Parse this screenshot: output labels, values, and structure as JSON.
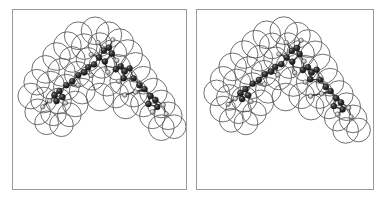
{
  "figure": {
    "kind": "stereo-pair-molecular-model",
    "panel_count": 2,
    "background_color": "#ffffff",
    "frame_color": "#9a9a9a",
    "vdw_outline_color": "#555555",
    "bond_color": "#3a3a3a",
    "atom_dark_color": "#1b1b1b",
    "atom_light_color": "#b4b4b4"
  },
  "panels": [
    {
      "id": "panel-left",
      "label": "left-eye-view",
      "x": 12,
      "y": 9,
      "width": 175,
      "height": 181,
      "view_offset_x": 0
    },
    {
      "id": "panel-right",
      "label": "right-eye-view",
      "x": 196,
      "y": 9,
      "width": 178,
      "height": 181,
      "view_offset_x": 2.5
    }
  ],
  "molecule": {
    "shape": "inverted-V / chevron arrangement of two extended arms meeting at an apex",
    "vdw_spheres": [
      {
        "cx": 66,
        "cy": 26,
        "r": 14
      },
      {
        "cx": 83,
        "cy": 21,
        "r": 14
      },
      {
        "cx": 97,
        "cy": 25,
        "r": 13
      },
      {
        "cx": 108,
        "cy": 33,
        "r": 14
      },
      {
        "cx": 55,
        "cy": 36,
        "r": 14
      },
      {
        "cx": 72,
        "cy": 37,
        "r": 13
      },
      {
        "cx": 88,
        "cy": 35,
        "r": 12
      },
      {
        "cx": 101,
        "cy": 44,
        "r": 14
      },
      {
        "cx": 116,
        "cy": 45,
        "r": 15
      },
      {
        "cx": 44,
        "cy": 47,
        "r": 14
      },
      {
        "cx": 60,
        "cy": 50,
        "r": 13
      },
      {
        "cx": 76,
        "cy": 50,
        "r": 12
      },
      {
        "cx": 90,
        "cy": 56,
        "r": 13
      },
      {
        "cx": 106,
        "cy": 58,
        "r": 13
      },
      {
        "cx": 124,
        "cy": 58,
        "r": 15
      },
      {
        "cx": 33,
        "cy": 60,
        "r": 14
      },
      {
        "cx": 49,
        "cy": 63,
        "r": 14
      },
      {
        "cx": 65,
        "cy": 65,
        "r": 13
      },
      {
        "cx": 80,
        "cy": 68,
        "r": 13
      },
      {
        "cx": 95,
        "cy": 72,
        "r": 15
      },
      {
        "cx": 112,
        "cy": 72,
        "r": 14
      },
      {
        "cx": 132,
        "cy": 71,
        "r": 14
      },
      {
        "cx": 24,
        "cy": 73,
        "r": 13
      },
      {
        "cx": 38,
        "cy": 76,
        "r": 14
      },
      {
        "cx": 54,
        "cy": 78,
        "r": 13
      },
      {
        "cx": 70,
        "cy": 82,
        "r": 13
      },
      {
        "cx": 88,
        "cy": 88,
        "r": 14
      },
      {
        "cx": 104,
        "cy": 86,
        "r": 13
      },
      {
        "cx": 122,
        "cy": 84,
        "r": 14
      },
      {
        "cx": 142,
        "cy": 83,
        "r": 14
      },
      {
        "cx": 18,
        "cy": 87,
        "r": 13
      },
      {
        "cx": 31,
        "cy": 91,
        "r": 13
      },
      {
        "cx": 46,
        "cy": 92,
        "r": 13
      },
      {
        "cx": 63,
        "cy": 95,
        "r": 13
      },
      {
        "cx": 114,
        "cy": 97,
        "r": 13
      },
      {
        "cx": 132,
        "cy": 95,
        "r": 13
      },
      {
        "cx": 150,
        "cy": 95,
        "r": 14
      },
      {
        "cx": 25,
        "cy": 103,
        "r": 13
      },
      {
        "cx": 41,
        "cy": 104,
        "r": 13
      },
      {
        "cx": 57,
        "cy": 106,
        "r": 12
      },
      {
        "cx": 141,
        "cy": 107,
        "r": 13
      },
      {
        "cx": 157,
        "cy": 107,
        "r": 14
      },
      {
        "cx": 34,
        "cy": 114,
        "r": 12
      },
      {
        "cx": 49,
        "cy": 116,
        "r": 12
      },
      {
        "cx": 150,
        "cy": 119,
        "r": 13
      },
      {
        "cx": 163,
        "cy": 118,
        "r": 12
      }
    ],
    "atoms": [
      {
        "cx": 86,
        "cy": 33,
        "r": 2.3,
        "kind": "light"
      },
      {
        "cx": 101,
        "cy": 30,
        "r": 2.2,
        "kind": "light"
      },
      {
        "cx": 92,
        "cy": 41,
        "r": 3.1,
        "kind": "dark"
      },
      {
        "cx": 97,
        "cy": 38,
        "r": 3.0,
        "kind": "dark"
      },
      {
        "cx": 100,
        "cy": 44,
        "r": 3.0,
        "kind": "dark"
      },
      {
        "cx": 79,
        "cy": 45,
        "r": 2.2,
        "kind": "light"
      },
      {
        "cx": 87,
        "cy": 48,
        "r": 3.0,
        "kind": "dark"
      },
      {
        "cx": 93,
        "cy": 52,
        "r": 2.9,
        "kind": "dark"
      },
      {
        "cx": 105,
        "cy": 51,
        "r": 2.3,
        "kind": "light"
      },
      {
        "cx": 82,
        "cy": 55,
        "r": 3.0,
        "kind": "dark"
      },
      {
        "cx": 76,
        "cy": 58,
        "r": 3.0,
        "kind": "dark"
      },
      {
        "cx": 72,
        "cy": 63,
        "r": 3.1,
        "kind": "dark"
      },
      {
        "cx": 66,
        "cy": 66,
        "r": 3.0,
        "kind": "dark"
      },
      {
        "cx": 79,
        "cy": 66,
        "r": 2.4,
        "kind": "light"
      },
      {
        "cx": 104,
        "cy": 60,
        "r": 3.0,
        "kind": "dark"
      },
      {
        "cx": 109,
        "cy": 57,
        "r": 3.0,
        "kind": "dark"
      },
      {
        "cx": 113,
        "cy": 62,
        "r": 3.1,
        "kind": "dark"
      },
      {
        "cx": 118,
        "cy": 59,
        "r": 2.9,
        "kind": "dark"
      },
      {
        "cx": 112,
        "cy": 69,
        "r": 3.0,
        "kind": "dark"
      },
      {
        "cx": 107,
        "cy": 72,
        "r": 2.3,
        "kind": "light"
      },
      {
        "cx": 122,
        "cy": 69,
        "r": 2.9,
        "kind": "dark"
      },
      {
        "cx": 60,
        "cy": 72,
        "r": 3.0,
        "kind": "dark"
      },
      {
        "cx": 54,
        "cy": 76,
        "r": 3.0,
        "kind": "dark"
      },
      {
        "cx": 66,
        "cy": 76,
        "r": 2.3,
        "kind": "light"
      },
      {
        "cx": 47,
        "cy": 82,
        "r": 3.0,
        "kind": "dark"
      },
      {
        "cx": 42,
        "cy": 86,
        "r": 3.1,
        "kind": "dark"
      },
      {
        "cx": 50,
        "cy": 88,
        "r": 3.0,
        "kind": "dark"
      },
      {
        "cx": 44,
        "cy": 92,
        "r": 3.0,
        "kind": "dark"
      },
      {
        "cx": 37,
        "cy": 92,
        "r": 2.3,
        "kind": "light"
      },
      {
        "cx": 53,
        "cy": 94,
        "r": 2.3,
        "kind": "light"
      },
      {
        "cx": 30,
        "cy": 98,
        "r": 2.2,
        "kind": "light"
      },
      {
        "cx": 128,
        "cy": 76,
        "r": 3.0,
        "kind": "dark"
      },
      {
        "cx": 133,
        "cy": 80,
        "r": 3.0,
        "kind": "dark"
      },
      {
        "cx": 124,
        "cy": 83,
        "r": 2.3,
        "kind": "light"
      },
      {
        "cx": 139,
        "cy": 87,
        "r": 3.0,
        "kind": "dark"
      },
      {
        "cx": 144,
        "cy": 91,
        "r": 3.1,
        "kind": "dark"
      },
      {
        "cx": 137,
        "cy": 95,
        "r": 3.0,
        "kind": "dark"
      },
      {
        "cx": 146,
        "cy": 98,
        "r": 2.9,
        "kind": "dark"
      },
      {
        "cx": 152,
        "cy": 96,
        "r": 2.3,
        "kind": "light"
      },
      {
        "cx": 141,
        "cy": 103,
        "r": 2.3,
        "kind": "light"
      },
      {
        "cx": 155,
        "cy": 105,
        "r": 2.2,
        "kind": "light"
      },
      {
        "cx": 113,
        "cy": 86,
        "r": 2.3,
        "kind": "light"
      },
      {
        "cx": 96,
        "cy": 63,
        "r": 2.3,
        "kind": "light"
      }
    ],
    "bonds": [
      [
        86,
        33,
        92,
        41
      ],
      [
        101,
        30,
        97,
        38
      ],
      [
        92,
        41,
        97,
        38
      ],
      [
        97,
        38,
        100,
        44
      ],
      [
        92,
        41,
        87,
        48
      ],
      [
        100,
        44,
        105,
        51
      ],
      [
        87,
        48,
        93,
        52
      ],
      [
        93,
        52,
        100,
        44
      ],
      [
        87,
        48,
        82,
        55
      ],
      [
        82,
        55,
        76,
        58
      ],
      [
        76,
        58,
        72,
        63
      ],
      [
        72,
        63,
        66,
        66
      ],
      [
        72,
        63,
        79,
        66
      ],
      [
        66,
        66,
        60,
        72
      ],
      [
        60,
        72,
        54,
        76
      ],
      [
        54,
        76,
        66,
        76
      ],
      [
        54,
        76,
        47,
        82
      ],
      [
        47,
        82,
        42,
        86
      ],
      [
        47,
        82,
        50,
        88
      ],
      [
        42,
        86,
        44,
        92
      ],
      [
        50,
        88,
        44,
        92
      ],
      [
        42,
        86,
        37,
        92
      ],
      [
        50,
        88,
        53,
        94
      ],
      [
        37,
        92,
        30,
        98
      ],
      [
        79,
        45,
        87,
        48
      ],
      [
        93,
        52,
        96,
        63
      ],
      [
        105,
        51,
        104,
        60
      ],
      [
        104,
        60,
        109,
        57
      ],
      [
        109,
        57,
        113,
        62
      ],
      [
        113,
        62,
        118,
        59
      ],
      [
        113,
        62,
        112,
        69
      ],
      [
        112,
        69,
        107,
        72
      ],
      [
        112,
        69,
        122,
        69
      ],
      [
        118,
        59,
        122,
        69
      ],
      [
        122,
        69,
        128,
        76
      ],
      [
        128,
        76,
        133,
        80
      ],
      [
        133,
        80,
        124,
        83
      ],
      [
        133,
        80,
        139,
        87
      ],
      [
        139,
        87,
        144,
        91
      ],
      [
        139,
        87,
        137,
        95
      ],
      [
        144,
        91,
        146,
        98
      ],
      [
        137,
        95,
        146,
        98
      ],
      [
        144,
        91,
        152,
        96
      ],
      [
        146,
        98,
        141,
        103
      ],
      [
        152,
        96,
        155,
        105
      ],
      [
        133,
        80,
        113,
        86
      ]
    ]
  }
}
